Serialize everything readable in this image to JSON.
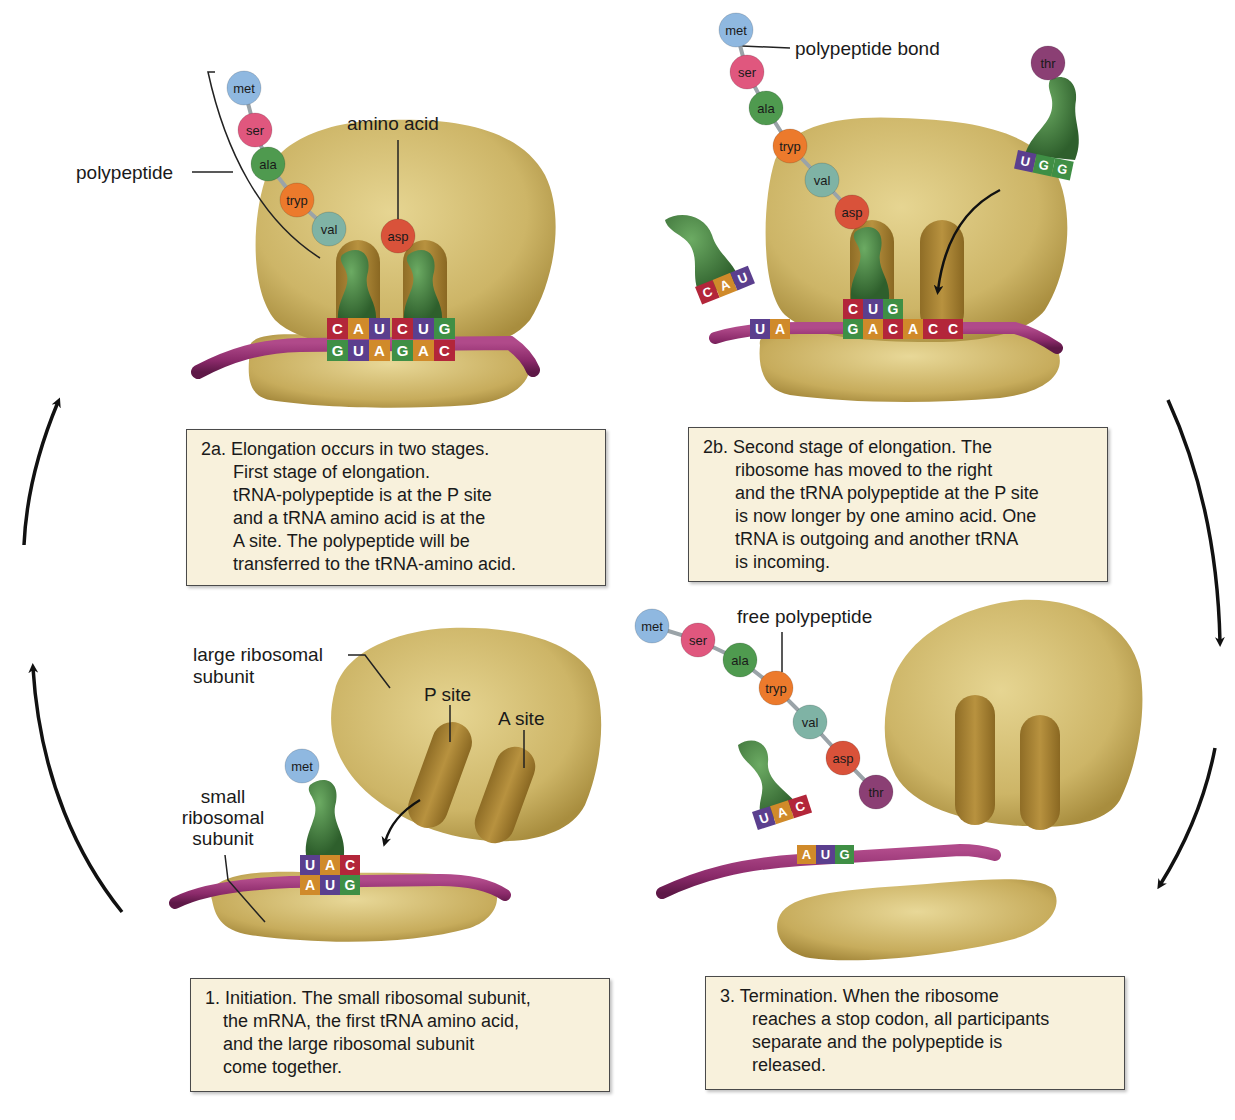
{
  "colors": {
    "ribosome": "#c9b163",
    "ribosome_dark": "#9c8238",
    "ribosome_light": "#e2d28f",
    "trna": "#3f7a3c",
    "mrna": "#8b2a6a",
    "caption_bg": "#f8f1dc",
    "nucleotide_A": "#d08a2a",
    "nucleotide_U": "#5b3f8e",
    "nucleotide_C": "#b3263a",
    "nucleotide_G": "#3f8f45",
    "aa_met": "#8fb8e0",
    "aa_ser": "#e0577e",
    "aa_ala": "#4f9a4f",
    "aa_tryp": "#ec7a2c",
    "aa_val": "#7fb3a5",
    "aa_asp": "#d9523a",
    "aa_thr": "#8b3f74"
  },
  "panel_2a": {
    "labels": {
      "polypeptide": "polypeptide",
      "amino_acid": "amino acid"
    },
    "chain": [
      "met",
      "ser",
      "ala",
      "tryp",
      "val"
    ],
    "incoming_aa": "asp",
    "anticodons": [
      [
        "C",
        "A",
        "U"
      ],
      [
        "C",
        "U",
        "G"
      ]
    ],
    "codons": [
      [
        "G",
        "U",
        "A"
      ],
      [
        "G",
        "A",
        "C"
      ]
    ],
    "caption": {
      "number": "2a.",
      "lines": [
        "Elongation occurs in two stages.",
        "First stage of elongation.",
        "tRNA-polypeptide is at the P site",
        "and a tRNA amino acid is at the",
        "A site. The polypeptide will be",
        "transferred to the tRNA-amino acid."
      ]
    }
  },
  "panel_2b": {
    "labels": {
      "polypeptide_bond": "polypeptide bond"
    },
    "chain": [
      "met",
      "ser",
      "ala",
      "tryp",
      "val",
      "asp"
    ],
    "incoming_aa": "thr",
    "incoming_anticodon": [
      "U",
      "G",
      "G"
    ],
    "outgoing_anticodon": [
      "C",
      "A",
      "U"
    ],
    "p_site_anticodon": [
      "C",
      "U",
      "G"
    ],
    "mrna_left": [
      "U",
      "A"
    ],
    "mrna_codons": [
      "G",
      "A",
      "C",
      "A",
      "C",
      "C"
    ],
    "caption": {
      "number": "2b.",
      "lines": [
        "Second stage of elongation. The",
        "ribosome has moved to the right",
        "and the tRNA polypeptide at the P site",
        "is now longer by one amino acid. One",
        "tRNA is outgoing and another tRNA",
        "is incoming."
      ]
    }
  },
  "panel_1": {
    "labels": {
      "large_subunit": [
        "large ribosomal",
        "subunit"
      ],
      "small_subunit": [
        "small",
        "ribosomal",
        "subunit"
      ],
      "p_site": "P site",
      "a_site": "A site"
    },
    "initiator_aa": "met",
    "anticodon": [
      "U",
      "A",
      "C"
    ],
    "codon": [
      "A",
      "U",
      "G"
    ],
    "caption": {
      "number": "1.",
      "lines": [
        "Initiation. The small ribosomal subunit,",
        "the mRNA, the first tRNA amino acid,",
        "and the large ribosomal subunit",
        "come together."
      ]
    }
  },
  "panel_3": {
    "labels": {
      "free_polypeptide": "free polypeptide"
    },
    "chain": [
      "met",
      "ser",
      "ala",
      "tryp",
      "val",
      "asp",
      "thr"
    ],
    "released_anticodon": [
      "U",
      "A",
      "C"
    ],
    "mrna_codon": [
      "A",
      "U",
      "G"
    ],
    "caption": {
      "number": "3.",
      "lines": [
        "Termination. When the ribosome",
        "reaches a stop codon, all participants",
        "separate and the polypeptide is",
        "released."
      ]
    }
  },
  "cycle_arrows": [
    "left-upper-up",
    "left-lower-up",
    "right-upper-down",
    "right-lower-down"
  ]
}
